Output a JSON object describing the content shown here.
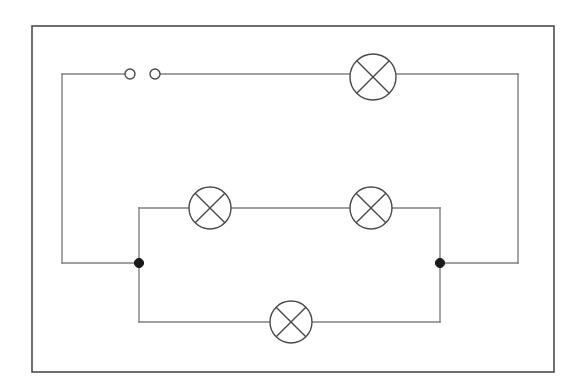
{
  "figure": {
    "kind": "circuit-diagram",
    "title": "Electrical circuit diagram with switch and five lamps",
    "canvas": {
      "width": 588,
      "height": 390
    },
    "background_color": "#ffffff"
  },
  "style": {
    "frame_color": "#4d4d4d",
    "frame_width": 1.6,
    "wire_color": "#808080",
    "wire_width": 1.4,
    "component_color": "#4a4a4a",
    "component_width": 1.4,
    "node_fill": "#1a1a1a",
    "terminal_fill": "#ffffff"
  },
  "frame": {
    "label": "diagram-border",
    "x": 32,
    "y": 26,
    "width": 522,
    "height": 346
  },
  "lamps": [
    {
      "id": "lamp-top",
      "label": "Lamp 1 (top branch, in series with switch)",
      "cx": 373,
      "cy": 77,
      "r": 23,
      "cross_angle_deg": 45
    },
    {
      "id": "lamp-middle-left",
      "label": "Lamp 2 (middle branch, left)",
      "cx": 210,
      "cy": 208,
      "r": 21,
      "cross_angle_deg": 45
    },
    {
      "id": "lamp-middle-right",
      "label": "Lamp 3 (middle branch, right)",
      "cx": 371,
      "cy": 208,
      "r": 21,
      "cross_angle_deg": 45
    },
    {
      "id": "lamp-bottom",
      "label": "Lamp 4 (bottom branch)",
      "cx": 291,
      "cy": 322,
      "r": 21,
      "cross_angle_deg": 45
    }
  ],
  "switch": {
    "id": "open-switch",
    "label": "Open switch (two terminals)",
    "terminals": [
      {
        "id": "switch-terminal-left",
        "cx": 130,
        "cy": 74,
        "r": 5
      },
      {
        "id": "switch-terminal-right",
        "cx": 155,
        "cy": 74,
        "r": 5
      }
    ],
    "state": "open"
  },
  "nodes": [
    {
      "id": "junction-left",
      "label": "Left junction node",
      "cx": 139,
      "cy": 263,
      "r": 4.6
    },
    {
      "id": "junction-right",
      "label": "Right junction node",
      "cx": 440,
      "cy": 263,
      "r": 4.6
    }
  ],
  "wires": [
    {
      "id": "wire-switch-left-stub",
      "label": "Wire from top-left corner to left switch terminal",
      "points": "62,74 125,74"
    },
    {
      "id": "wire-switch-right-to-lamp",
      "label": "Wire from right switch terminal to top lamp",
      "points": "160,74 350,74"
    },
    {
      "id": "wire-lamp-top-to-right",
      "label": "Wire from top lamp to top-right corner",
      "points": "396,74 518,74"
    },
    {
      "id": "wire-right-vertical",
      "label": "Right outer vertical wire",
      "points": "518,74 518,263"
    },
    {
      "id": "wire-right-bottom-to-node",
      "label": "Wire from right outer corner to right junction",
      "points": "518,263 440,263"
    },
    {
      "id": "wire-left-vertical",
      "label": "Left outer vertical wire",
      "points": "62,74 62,263"
    },
    {
      "id": "wire-left-bottom-to-node",
      "label": "Wire from left outer corner to left junction",
      "points": "62,263 139,263"
    },
    {
      "id": "wire-middle-branch-left-riser",
      "label": "Middle branch left riser",
      "points": "139,263 139,208"
    },
    {
      "id": "wire-middle-branch-left-run",
      "label": "Wire from left riser to middle-left lamp",
      "points": "139,208 189,208"
    },
    {
      "id": "wire-middle-branch-center",
      "label": "Wire between the two middle lamps",
      "points": "231,208 350,208"
    },
    {
      "id": "wire-middle-branch-right-run",
      "label": "Wire from middle-right lamp to right riser",
      "points": "392,208 440,208"
    },
    {
      "id": "wire-middle-branch-right-riser",
      "label": "Middle branch right riser",
      "points": "440,208 440,263"
    },
    {
      "id": "wire-bottom-branch-left-drop",
      "label": "Bottom branch left drop",
      "points": "139,263 139,322"
    },
    {
      "id": "wire-bottom-branch-left-run",
      "label": "Wire from left drop to bottom lamp",
      "points": "139,322 270,322"
    },
    {
      "id": "wire-bottom-branch-right-run",
      "label": "Wire from bottom lamp to right drop",
      "points": "312,322 440,322"
    },
    {
      "id": "wire-bottom-branch-right-drop",
      "label": "Bottom branch right drop",
      "points": "440,322 440,263"
    }
  ],
  "legend": {
    "lamp_symbol_name": "lamp-circle-with-cross",
    "switch_symbol_name": "open-switch-terminals",
    "node_symbol_name": "filled-junction-dot"
  }
}
